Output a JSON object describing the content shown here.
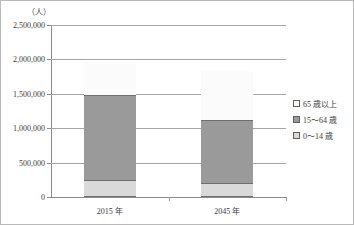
{
  "chart_data": {
    "type": "bar",
    "subtype": "stacked-vertical",
    "title": "",
    "unit_label": "（人）",
    "xlabel": "",
    "ylabel": "",
    "categories": [
      "2015 年",
      "2045 年"
    ],
    "ylim": [
      0,
      2500000
    ],
    "ytick_values": [
      0,
      500000,
      1000000,
      1500000,
      2000000,
      2500000
    ],
    "ytick_labels": [
      "0",
      "500,000",
      "1,000,000",
      "1,500,000",
      "2,000,000",
      "2,500,000"
    ],
    "grid": true,
    "grid_axis": "y",
    "legend_position": "right",
    "stack_order_bottom_to_top": [
      "0～14 歳",
      "15～64 歳",
      "65 歳以上"
    ],
    "series": [
      {
        "name": "0～14 歳",
        "color": "#d9d9d9",
        "values": [
          225000,
          170000
        ]
      },
      {
        "name": "15～64 歳",
        "color": "#9a9a9a",
        "values": [
          1245000,
          935000
        ]
      },
      {
        "name": "65 歳以上",
        "color": "#fbfbfb",
        "values": [
          460000,
          705000
        ]
      }
    ],
    "totals": [
      1930000,
      1810000
    ],
    "cumulative_tops": [
      [
        225000,
        1470000,
        1930000
      ],
      [
        170000,
        1105000,
        1810000
      ]
    ]
  },
  "legend": {
    "items": [
      {
        "label": "65 歳以上",
        "swatch": "legend-swatch-65-and-over"
      },
      {
        "label": "15～64 歳",
        "swatch": "legend-swatch-15-to-64"
      },
      {
        "label": "0～14 歳",
        "swatch": "legend-swatch-0-to-14"
      }
    ]
  },
  "axes": {
    "unit": "（人）",
    "y_labels": [
      "2,500,000",
      "2,000,000",
      "1,500,000",
      "1,000,000",
      "500,000",
      "0"
    ],
    "x_labels": [
      "2015 年",
      "2045 年"
    ]
  },
  "colors": {
    "segment_old": "#fbfbfb",
    "segment_mid": "#9a9a9a",
    "segment_young": "#d9d9d9",
    "gridline": "#a6a6a6",
    "bar_outline": "#6e6e6e",
    "frame": "#b9b9b9"
  }
}
